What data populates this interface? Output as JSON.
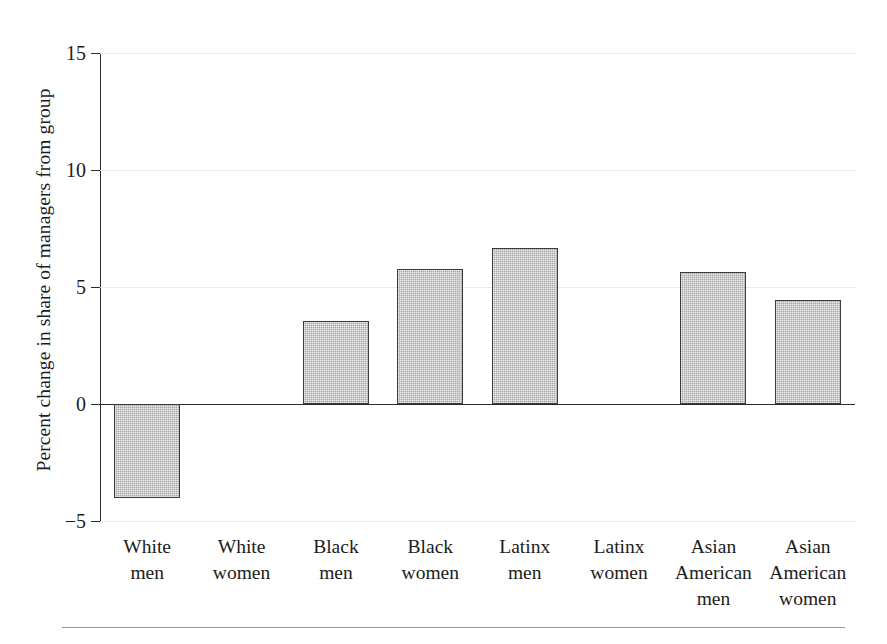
{
  "chart_data": {
    "type": "bar",
    "title": "",
    "subtitle": "",
    "xlabel": "",
    "ylabel": "Percent change in share of managers from group",
    "ylim": [
      -5,
      15
    ],
    "yticks": [
      -5,
      0,
      5,
      10,
      15
    ],
    "ytick_labels": [
      "−5",
      "0",
      "5",
      "10",
      "15"
    ],
    "grid": true,
    "grid_axis": "y",
    "legend": "none",
    "zero_line": true,
    "bar_fill_color": "#a8a8a8",
    "bar_edge_color": "#3c3c3c",
    "categories": [
      "White men",
      "White women",
      "Black men",
      "Black women",
      "Latinx men",
      "Latinx women",
      "Asian American men",
      "Asian American women"
    ],
    "category_label_lines": [
      [
        "White",
        "men"
      ],
      [
        "White",
        "women"
      ],
      [
        "Black",
        "men"
      ],
      [
        "Black",
        "women"
      ],
      [
        "Latinx",
        "men"
      ],
      [
        "Latinx",
        "women"
      ],
      [
        "Asian",
        "American",
        "men"
      ],
      [
        "Asian",
        "American",
        "women"
      ]
    ],
    "values": [
      -4.0,
      0.0,
      3.55,
      5.75,
      6.65,
      0.0,
      5.65,
      4.45
    ],
    "value_labels": [
      "-4.0",
      "0.0",
      "3.55",
      "5.75",
      "6.65",
      "0.0",
      "5.65",
      "4.45"
    ]
  },
  "axis": {
    "y_title": "Percent change in share of managers from group",
    "ticks": [
      {
        "label": "15",
        "value": 15
      },
      {
        "label": "10",
        "value": 10
      },
      {
        "label": "5",
        "value": 5
      },
      {
        "label": "0",
        "value": 0
      },
      {
        "label": "−5",
        "value": -5
      }
    ]
  },
  "x_labels": [
    {
      "line1": "White",
      "line2": "men",
      "line3": ""
    },
    {
      "line1": "White",
      "line2": "women",
      "line3": ""
    },
    {
      "line1": "Black",
      "line2": "men",
      "line3": ""
    },
    {
      "line1": "Black",
      "line2": "women",
      "line3": ""
    },
    {
      "line1": "Latinx",
      "line2": "men",
      "line3": ""
    },
    {
      "line1": "Latinx",
      "line2": "women",
      "line3": ""
    },
    {
      "line1": "Asian",
      "line2": "American",
      "line3": "men"
    },
    {
      "line1": "Asian",
      "line2": "American",
      "line3": "women"
    }
  ]
}
